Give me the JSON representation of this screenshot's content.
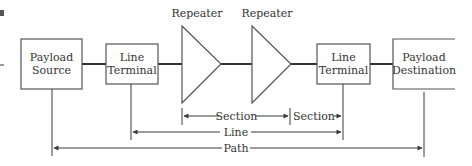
{
  "diagram": {
    "nodes": [
      {
        "id": "payload-source",
        "line1": "Payload",
        "line2": "Source"
      },
      {
        "id": "line-terminal-1",
        "line1": "Line",
        "line2": "Terminal"
      },
      {
        "id": "repeater-1",
        "label": "Repeater"
      },
      {
        "id": "repeater-2",
        "label": "Repeater"
      },
      {
        "id": "line-terminal-2",
        "line1": "Line",
        "line2": "Terminal"
      },
      {
        "id": "payload-destination",
        "line1": "Payload",
        "line2": "Destination"
      }
    ],
    "spans": {
      "section_1": "Section",
      "section_2": "Section",
      "line": "Line",
      "path": "Path"
    },
    "colors": {
      "stroke": "#4a4a4a",
      "text": "#333333",
      "background": "#ffffff"
    }
  }
}
